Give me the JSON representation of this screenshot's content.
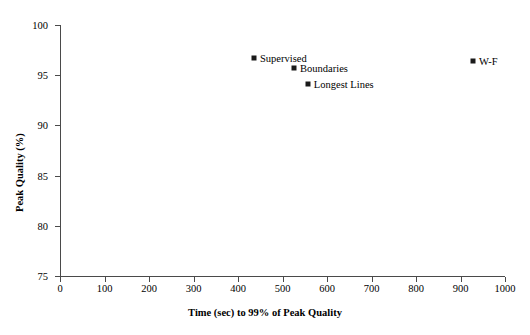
{
  "chart_data": {
    "type": "scatter",
    "title": "",
    "xlabel": "Time (sec) to 99% of Peak Quality",
    "ylabel": "Peak Quality (%)",
    "xlim": [
      0,
      1000
    ],
    "ylim": [
      75,
      100
    ],
    "xticks": [
      0,
      100,
      200,
      300,
      400,
      500,
      600,
      700,
      800,
      900,
      1000
    ],
    "yticks": [
      75,
      80,
      85,
      90,
      95,
      100
    ],
    "xtick_labels": [
      "0",
      "100",
      "200",
      "300",
      "400",
      "500",
      "600",
      "700",
      "800",
      "900",
      "1000"
    ],
    "ytick_labels": [
      "75",
      "80",
      "85",
      "90",
      "95",
      "100"
    ],
    "grid": false,
    "legend": "none",
    "marker": "square",
    "marker_color": "#1a1a1a",
    "points": [
      {
        "label": "Supervised",
        "x": 436,
        "y": 96.7
      },
      {
        "label": "Boundaries",
        "x": 526,
        "y": 95.7
      },
      {
        "label": "Longest Lines",
        "x": 557,
        "y": 94.1
      },
      {
        "label": "W-F",
        "x": 928,
        "y": 96.4
      }
    ]
  }
}
